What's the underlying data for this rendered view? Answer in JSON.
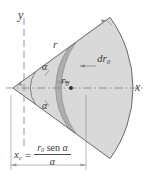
{
  "figure": {
    "axes": {
      "y_label": "y",
      "x_label": "x"
    },
    "labels": {
      "outer_radius": "r",
      "element_radius": "r₀",
      "element_thickness": "dr₀",
      "angle_upper": "α",
      "angle_lower": "α"
    },
    "formula": {
      "lhs": "x",
      "lhs_sub": "c",
      "equals": "=",
      "numerator_var": "r",
      "numerator_sub": "0",
      "numerator_fn": "sen",
      "numerator_angle": "α",
      "denominator": "α",
      "plain": "x_c = r₀ sen α / α"
    },
    "colors": {
      "sector_fill": "#d9d9d9",
      "strip_fill": "#aeaeae",
      "outline": "#5a5a5a",
      "axis": "#8a8a8a",
      "text": "#3b3b3b",
      "background": "#ffffff"
    },
    "geometry": {
      "apex_x": 13,
      "apex_y": 88,
      "outer_radius_px": 120,
      "inner_arc_radius_px": 28,
      "strip_inner_px": 69,
      "strip_outer_px": 78,
      "half_angle_deg": 36
    }
  }
}
